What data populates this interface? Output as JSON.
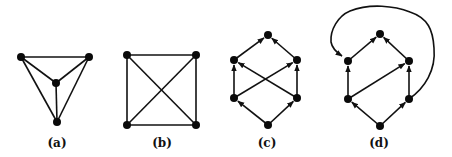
{
  "figure": {
    "panels": [
      {
        "id": "a",
        "label": "(a)",
        "label_pos": [
          57,
          147
        ],
        "directed": false,
        "nodes": [
          [
            21,
            57
          ],
          [
            89,
            57
          ],
          [
            56,
            83
          ],
          [
            57,
            122
          ]
        ],
        "edges": [
          [
            0,
            1
          ],
          [
            0,
            2
          ],
          [
            1,
            2
          ],
          [
            0,
            3
          ],
          [
            1,
            3
          ],
          [
            2,
            3
          ]
        ]
      },
      {
        "id": "b",
        "label": "(b)",
        "label_pos": [
          162,
          147
        ],
        "directed": false,
        "nodes": [
          [
            127,
            55
          ],
          [
            196,
            55
          ],
          [
            127,
            125
          ],
          [
            196,
            125
          ]
        ],
        "edges": [
          [
            0,
            1
          ],
          [
            0,
            2
          ],
          [
            1,
            3
          ],
          [
            2,
            3
          ],
          [
            0,
            3
          ],
          [
            1,
            2
          ]
        ]
      },
      {
        "id": "c",
        "label": "(c)",
        "label_pos": [
          267,
          147
        ],
        "directed": true,
        "nodes": [
          [
            268,
            35
          ],
          [
            234,
            60
          ],
          [
            297,
            60
          ],
          [
            234,
            98
          ],
          [
            297,
            98
          ],
          [
            268,
            125
          ]
        ],
        "edges": [
          [
            5,
            3
          ],
          [
            5,
            4
          ],
          [
            3,
            1
          ],
          [
            4,
            2
          ],
          [
            3,
            2
          ],
          [
            4,
            1
          ],
          [
            1,
            0
          ],
          [
            2,
            0
          ]
        ]
      },
      {
        "id": "d",
        "label": "(d)",
        "label_pos": [
          379,
          147
        ],
        "directed": true,
        "nodes": [
          [
            380,
            34
          ],
          [
            348,
            61
          ],
          [
            409,
            61
          ],
          [
            348,
            99
          ],
          [
            409,
            99
          ],
          [
            380,
            126
          ]
        ],
        "edges": [
          [
            5,
            3
          ],
          [
            5,
            4
          ],
          [
            3,
            1
          ],
          [
            4,
            2
          ],
          [
            3,
            2
          ],
          [
            1,
            0
          ],
          [
            2,
            0
          ]
        ],
        "curved_edge": {
          "from": 4,
          "to": 1,
          "path": "M409,99 C425,88 436,70 434,48 C433,30 428,18 410,12 C395,6 370,3 350,11 C338,16 330,30 331,42 C332,48 336,52 342,56"
        }
      }
    ]
  }
}
